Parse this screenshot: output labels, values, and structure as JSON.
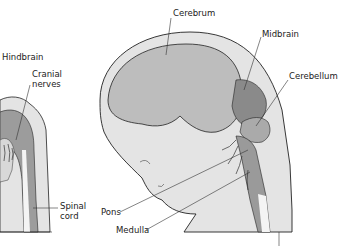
{
  "diagram": {
    "type": "anatomical-illustration",
    "panels": [
      {
        "id": "left-embryo",
        "labels": [
          {
            "text": "Hindbrain",
            "x": 2,
            "y": 56
          },
          {
            "text": "Cranial",
            "x": 32,
            "y": 73
          },
          {
            "text": "nerves",
            "x": 32,
            "y": 83
          },
          {
            "text": "Spinal",
            "x": 60,
            "y": 205
          },
          {
            "text": "cord",
            "x": 60,
            "y": 215
          }
        ]
      },
      {
        "id": "right-fetus",
        "labels": [
          {
            "text": "Cerebrum",
            "x": 173,
            "y": 10
          },
          {
            "text": "Midbrain",
            "x": 262,
            "y": 31
          },
          {
            "text": "Cerebellum",
            "x": 289,
            "y": 73
          },
          {
            "text": "Pons",
            "x": 101,
            "y": 210
          },
          {
            "text": "Medulla",
            "x": 116,
            "y": 228
          }
        ]
      }
    ],
    "colors": {
      "skin": "#e4e4e4",
      "cerebrum": "#bdbdbd",
      "midbrain": "#8a8a8a",
      "hindbrain": "#9c9c9c",
      "spinal_cord": "#f4f4f4",
      "outline": "#222222"
    }
  }
}
